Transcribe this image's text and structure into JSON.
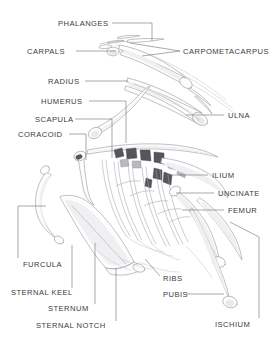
{
  "diagram": {
    "background_color": "#ffffff",
    "text_color": "#3b3b3d",
    "leader_line_color": "#6e6e72",
    "bone_outline_color": "#9a9aa0",
    "bone_fill_color": "#fdfdfd",
    "width": 277,
    "height": 347
  },
  "labels": [
    {
      "id": "phalanges",
      "text": "PHALANGES",
      "x": 58,
      "y": 26,
      "anchor": "start"
    },
    {
      "id": "carpals",
      "text": "CARPALS",
      "x": 27,
      "y": 54,
      "anchor": "start"
    },
    {
      "id": "carpometacarpus",
      "text": "CARPOMETACARPUS",
      "x": 183,
      "y": 54,
      "anchor": "start"
    },
    {
      "id": "radius",
      "text": "RADIUS",
      "x": 48,
      "y": 84,
      "anchor": "start"
    },
    {
      "id": "humerus",
      "text": "HUMERUS",
      "x": 41,
      "y": 104,
      "anchor": "start"
    },
    {
      "id": "scapula",
      "text": "SCAPULA",
      "x": 35,
      "y": 122,
      "anchor": "start"
    },
    {
      "id": "coracoid",
      "text": "CORACOID",
      "x": 18,
      "y": 137,
      "anchor": "start"
    },
    {
      "id": "ulna",
      "text": "ULNA",
      "x": 228,
      "y": 118,
      "anchor": "start"
    },
    {
      "id": "ilium",
      "text": "ILIUM",
      "x": 212,
      "y": 178,
      "anchor": "start"
    },
    {
      "id": "uncinate",
      "text": "UNCINATE",
      "x": 218,
      "y": 196,
      "anchor": "start"
    },
    {
      "id": "femur",
      "text": "FEMUR",
      "x": 228,
      "y": 213,
      "anchor": "start"
    },
    {
      "id": "furcula",
      "text": "FURCULA",
      "x": 23,
      "y": 267,
      "anchor": "start"
    },
    {
      "id": "sternal-keel",
      "text": "STERNAL KEEL",
      "x": 11,
      "y": 295,
      "anchor": "start"
    },
    {
      "id": "sternum",
      "text": "STERNUM",
      "x": 48,
      "y": 311,
      "anchor": "start"
    },
    {
      "id": "sternal-notch",
      "text": "STERNAL NOTCH",
      "x": 36,
      "y": 328,
      "anchor": "start"
    },
    {
      "id": "ribs",
      "text": "RIBS",
      "x": 163,
      "y": 281,
      "anchor": "start"
    },
    {
      "id": "pubis",
      "text": "PUBIS",
      "x": 163,
      "y": 297,
      "anchor": "start"
    },
    {
      "id": "ischium",
      "text": "ISCHIUM",
      "x": 215,
      "y": 327,
      "anchor": "start"
    }
  ],
  "leaders": [
    {
      "id": "phalanges",
      "path": "M112 23 L152 23 L152 41"
    },
    {
      "id": "carpals",
      "path": "M76 51 L116 51"
    },
    {
      "id": "carpometacarpus",
      "path": "M180 51 L130 43"
    },
    {
      "id": "carpometacarpus2",
      "path": "M180 51 L142 56"
    },
    {
      "id": "radius",
      "path": "M85 81 L128 81"
    },
    {
      "id": "humerus",
      "path": "M89 101 L126 101 L126 143"
    },
    {
      "id": "scapula",
      "path": "M75 119 L112 119 L112 158"
    },
    {
      "id": "coracoid",
      "path": "M69 134 L86 134 L86 160"
    },
    {
      "id": "ulna",
      "path": "M224 115 L186 115"
    },
    {
      "id": "ilium",
      "path": "M208 175 L166 175"
    },
    {
      "id": "uncinate",
      "path": "M214 193 L176 193"
    },
    {
      "id": "femur",
      "path": "M224 210 L182 210"
    },
    {
      "id": "furcula",
      "path": "M18 258 L18 206 L46 206"
    },
    {
      "id": "sternal-keel",
      "path": "M72 288 L72 245"
    },
    {
      "id": "sternum",
      "path": "M95 304 L95 243"
    },
    {
      "id": "sternal-notch",
      "path": "M116 321 L116 268"
    },
    {
      "id": "ribs",
      "path": "M160 276 L145 259"
    },
    {
      "id": "pubis",
      "path": "M186 294 L224 294"
    },
    {
      "id": "ischium",
      "path": "M259 318 L259 237 L230 222"
    }
  ]
}
